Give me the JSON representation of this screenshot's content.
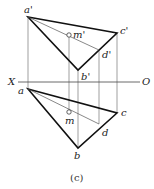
{
  "figure": {
    "caption": "(c)",
    "axis": {
      "left_label": "X",
      "right_label": "O"
    },
    "front_view": {
      "labels": {
        "a": "a'",
        "b": "b'",
        "c": "c'",
        "d": "d'",
        "m": "m'"
      }
    },
    "top_view": {
      "labels": {
        "a": "a",
        "b": "b",
        "c": "c",
        "d": "d",
        "m": "m"
      }
    },
    "colors": {
      "line": "#111111",
      "thin": "#555555",
      "background": "#ffffff"
    }
  }
}
